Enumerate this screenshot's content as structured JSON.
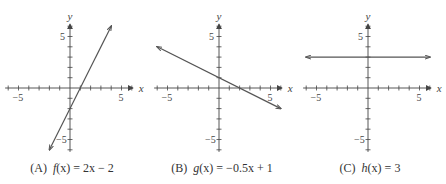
{
  "chart_data": [
    {
      "type": "line",
      "panel": "A",
      "caption": "(A)  f(x) = 2x − 2",
      "function": "f(x) = 2x - 2",
      "slope": 2,
      "intercept": -2,
      "x": [
        -2,
        4
      ],
      "y": [
        -6,
        6
      ],
      "xlabel": "x",
      "ylabel": "y",
      "xticks": [
        -5,
        5
      ],
      "yticks": [
        5,
        -5
      ],
      "xlim": [
        -6,
        6
      ],
      "ylim": [
        -6,
        6
      ],
      "grid": false,
      "arrows": true
    },
    {
      "type": "line",
      "panel": "B",
      "caption": "(B)  g(x) = −0.5x + 1",
      "function": "g(x) = -0.5x + 1",
      "slope": -0.5,
      "intercept": 1,
      "x": [
        -6,
        6
      ],
      "y": [
        4,
        -2
      ],
      "xlabel": "x",
      "ylabel": "y",
      "xticks": [
        -5,
        5
      ],
      "yticks": [
        5,
        -5
      ],
      "xlim": [
        -6,
        6
      ],
      "ylim": [
        -6,
        6
      ],
      "grid": false,
      "arrows": true
    },
    {
      "type": "line",
      "panel": "C",
      "caption": "(C)  h(x) = 3",
      "function": "h(x) = 3",
      "slope": 0,
      "intercept": 3,
      "x": [
        -6,
        6
      ],
      "y": [
        3,
        3
      ],
      "xlabel": "x",
      "ylabel": "y",
      "xticks": [
        -5,
        5
      ],
      "yticks": [
        5,
        -5
      ],
      "xlim": [
        -6,
        6
      ],
      "ylim": [
        -6,
        6
      ],
      "grid": false,
      "arrows": true
    }
  ],
  "captions": {
    "a": {
      "label": "(A)",
      "fn": "f",
      "arg": "(x)",
      "rhs": " = 2x − 2"
    },
    "b": {
      "label": "(B)",
      "fn": "g",
      "arg": "(x)",
      "rhs": " = −0.5x + 1"
    },
    "c": {
      "label": "(C)",
      "fn": "h",
      "arg": "(x)",
      "rhs": " = 3"
    }
  },
  "style": {
    "line_color": "#555555",
    "axis_color": "#444444"
  }
}
